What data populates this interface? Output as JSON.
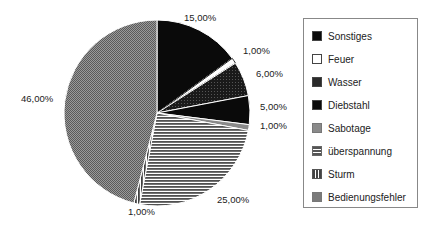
{
  "chart_data": {
    "type": "pie",
    "title": "",
    "start_angle_deg": 0,
    "direction": "clockwise",
    "categories": [
      "Sonstiges",
      "Feuer",
      "Wasser",
      "Diebstahl",
      "Sabotage",
      "überspannung",
      "Sturm",
      "Bedienungsfehler"
    ],
    "values": [
      15,
      1,
      6,
      5,
      1,
      25,
      1,
      46
    ],
    "labels": [
      "15,00%",
      "1,00%",
      "6,00%",
      "5,00%",
      "1,00%",
      "25,00%",
      "1,00%",
      "46,00%"
    ],
    "legend_position": "right"
  },
  "slices": [
    {
      "name": "Sonstiges",
      "pattern": "solid-black",
      "label": "15,00%"
    },
    {
      "name": "Feuer",
      "pattern": "white",
      "label": "1,00%"
    },
    {
      "name": "Wasser",
      "pattern": "dark-speckle",
      "label": "6,00%"
    },
    {
      "name": "Diebstahl",
      "pattern": "solid-black",
      "label": "5,00%"
    },
    {
      "name": "Sabotage",
      "pattern": "gray",
      "label": "1,00%"
    },
    {
      "name": "überspannung",
      "pattern": "horizontal-stripes",
      "label": "25,00%"
    },
    {
      "name": "Sturm",
      "pattern": "vertical-stripes",
      "label": "1,00%"
    },
    {
      "name": "Bedienungsfehler",
      "pattern": "crosshatch",
      "label": "46,00%"
    }
  ],
  "legend": {
    "items": [
      "Sonstiges",
      "Feuer",
      "Wasser",
      "Diebstahl",
      "Sabotage",
      "überspannung",
      "Sturm",
      "Bedienungsfehler"
    ]
  },
  "colors": {
    "black": "#0a0a0a",
    "gray": "#8a8a8a",
    "stripe_dark": "#555555",
    "crosshatch": "#7a7a7a"
  }
}
